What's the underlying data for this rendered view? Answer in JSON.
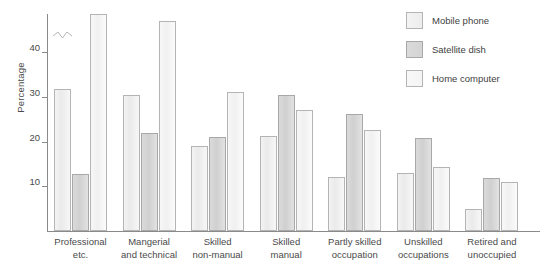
{
  "chart_data": {
    "type": "bar",
    "title": "",
    "xlabel": "",
    "ylabel": "Percentage",
    "ylim": [
      0,
      50
    ],
    "yticks": [
      10,
      20,
      30,
      40
    ],
    "ytick_labels": [
      "10",
      "20",
      "30",
      "40"
    ],
    "grid": false,
    "legend_position": "top-right",
    "note": "Third bar of 'Professional etc.' is drawn with an axis-break zigzag because its value exceeds the plotted range.",
    "categories": [
      "Professional\netc.",
      "Mangerial\nand technical",
      "Skilled\nnon-manual",
      "Skilled\nmanual",
      "Partly skilled\noccupation",
      "Unskilled\noccupations",
      "Retired and\nunoccupied"
    ],
    "series": [
      {
        "name": "Mobile phone",
        "values": [
          31.8,
          30.3,
          19.0,
          21.3,
          12.0,
          13.0,
          5.0
        ]
      },
      {
        "name": "Satellite dish",
        "values": [
          12.7,
          22.0,
          21.0,
          30.5,
          26.2,
          20.7,
          11.8
        ]
      },
      {
        "name": "Home computer",
        "values": [
          56.0,
          47.0,
          31.0,
          27.0,
          22.5,
          14.2,
          11.0
        ]
      }
    ],
    "series_broken": [
      false,
      false,
      true
    ],
    "colors": {
      "mobile_phone": "#efefef",
      "satellite_dish": "#d6d6d6",
      "home_computer": "#f6f6f6",
      "axis": "#8a8a8a",
      "text": "#4a4a4a"
    }
  },
  "legend": {
    "items": [
      {
        "label": "Mobile phone"
      },
      {
        "label": "Satellite dish"
      },
      {
        "label": "Home computer"
      }
    ]
  }
}
